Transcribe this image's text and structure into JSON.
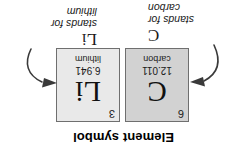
{
  "figure": {
    "caption": "Element symbol",
    "orientation_note": "rotated-180"
  },
  "elements": [
    {
      "id": "carbon",
      "atomic_number": "6",
      "symbol": "C",
      "atomic_mass": "12.011",
      "name": "carbon",
      "box_color": "#d2d2d2"
    },
    {
      "id": "lithium",
      "atomic_number": "3",
      "symbol": "Li",
      "atomic_mass": "6.941",
      "name": "lithium",
      "box_color": "#e9e9e9"
    }
  ],
  "annotations": [
    {
      "id": "carbon",
      "symbol": "C",
      "line1": "stands for",
      "line2": "carbon"
    },
    {
      "id": "lithium",
      "symbol": "Li",
      "line1": "stands for",
      "line2": "lithium"
    }
  ],
  "colors": {
    "text": "#1a1a1a",
    "border": "#6f6f6f",
    "arrow": "#3a3a3a",
    "background": "#ffffff"
  }
}
